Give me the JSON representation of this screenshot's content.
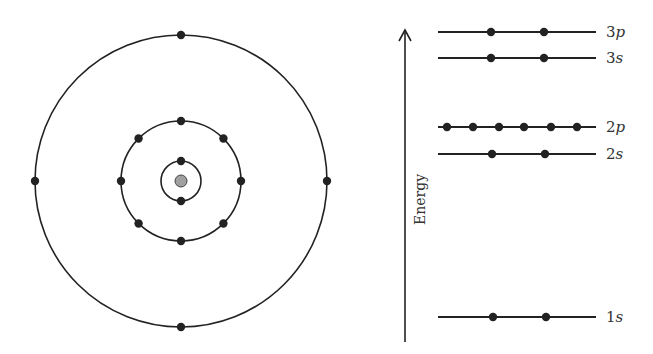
{
  "diagram": {
    "title": "",
    "colors": {
      "line": "#222222",
      "electron": "#222222",
      "nucleus": "#a0a0a0",
      "text": "#333333"
    },
    "bohr_model": {
      "center": [
        181,
        181
      ],
      "nucleus_radius": 6,
      "shells": [
        {
          "name": "n=1",
          "radius": 20,
          "electrons": 2,
          "angles": [
            -90,
            90
          ]
        },
        {
          "name": "n=2",
          "radius": 60,
          "electrons": 8,
          "angles": [
            -90,
            -45,
            0,
            45,
            90,
            135,
            180,
            225
          ]
        },
        {
          "name": "n=3",
          "radius": 146,
          "electrons": 4,
          "angles": [
            -90,
            0,
            90,
            180
          ]
        }
      ]
    },
    "energy_diagram": {
      "axis_label": "Energy",
      "axis_x": 405,
      "axis_top": 30,
      "axis_bottom": 342,
      "line_x1": 438,
      "line_x2": 596,
      "levels": [
        {
          "label_num": "3",
          "label_sub": "p",
          "y": 32,
          "electrons_x": [
            491,
            544
          ]
        },
        {
          "label_num": "3",
          "label_sub": "s",
          "y": 58,
          "electrons_x": [
            491,
            544
          ]
        },
        {
          "label_num": "2",
          "label_sub": "p",
          "y": 127,
          "electrons_x": [
            447,
            473,
            499,
            524,
            551,
            577
          ]
        },
        {
          "label_num": "2",
          "label_sub": "s",
          "y": 154,
          "electrons_x": [
            492,
            545
          ]
        },
        {
          "label_num": "1",
          "label_sub": "s",
          "y": 317,
          "electrons_x": [
            493,
            546
          ]
        }
      ]
    }
  }
}
